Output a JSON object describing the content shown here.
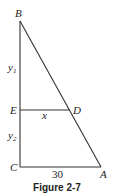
{
  "figure": {
    "caption": "Figure 2-7",
    "points": {
      "B": {
        "label": "B",
        "x": 20,
        "y": 21
      },
      "E": {
        "label": "E",
        "x": 20,
        "y": 110
      },
      "D": {
        "label": "D",
        "x": 72,
        "y": 110
      },
      "C": {
        "label": "C",
        "x": 20,
        "y": 167
      },
      "A": {
        "label": "A",
        "x": 101,
        "y": 167
      }
    },
    "segment_labels": {
      "y1": {
        "main": "y",
        "sub": "1"
      },
      "y2": {
        "main": "y",
        "sub": "2"
      },
      "x": "x",
      "CA": "30"
    },
    "colors": {
      "line": "#333333",
      "text": "#222222",
      "background": "#ffffff"
    }
  }
}
